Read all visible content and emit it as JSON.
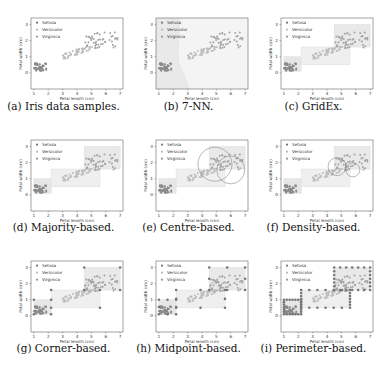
{
  "figure": {
    "panels": [
      {
        "id": "a",
        "caption": "(a) Iris data samples.",
        "overlay": "none"
      },
      {
        "id": "b",
        "caption": "(b) 7-NN.",
        "overlay": "knn"
      },
      {
        "id": "c",
        "caption": "(c) GridEx.",
        "overlay": "boxes"
      },
      {
        "id": "d",
        "caption": "(d) Majority-based.",
        "overlay": "boxes"
      },
      {
        "id": "e",
        "caption": "(e) Centre-based.",
        "overlay": "boxes-circles-large"
      },
      {
        "id": "f",
        "caption": "(f) Density-based.",
        "overlay": "boxes-circles-small"
      },
      {
        "id": "g",
        "caption": "(g) Corner-based.",
        "overlay": "boxes-corners"
      },
      {
        "id": "h",
        "caption": "(h) Midpoint-based.",
        "overlay": "boxes-midpoints"
      },
      {
        "id": "i",
        "caption": "(i) Perimeter-based.",
        "overlay": "boxes-perimeter"
      }
    ],
    "legend": [
      "Setosa",
      "Versicolor",
      "Virginica"
    ],
    "xlabel": "Petal length (cm)",
    "ylabel": "Petal width (cm)",
    "xticks": [
      "1",
      "2",
      "3",
      "4",
      "5",
      "6",
      "7"
    ],
    "yticks": [
      "0",
      "1",
      "2",
      "3"
    ]
  },
  "chart_data": {
    "type": "scatter",
    "title": "",
    "xlabel": "Petal length (cm)",
    "ylabel": "Petal width (cm)",
    "xlim": [
      0.8,
      7.2
    ],
    "ylim": [
      -1,
      3.4
    ],
    "grid": false,
    "legend_position": "upper left",
    "series": [
      {
        "name": "Setosa",
        "x_range": [
          1.0,
          1.9
        ],
        "y_range": [
          0.1,
          0.6
        ]
      },
      {
        "name": "Versicolor",
        "x_range": [
          3.0,
          5.1
        ],
        "y_range": [
          1.0,
          1.8
        ]
      },
      {
        "name": "Virginica",
        "x_range": [
          4.5,
          6.9
        ],
        "y_range": [
          1.4,
          2.5
        ]
      }
    ],
    "boxes_gridex": [
      {
        "class": "Setosa",
        "x": [
          1.0,
          2.2
        ],
        "y": [
          0.1,
          1.0
        ]
      },
      {
        "class": "Versicolor",
        "x": [
          2.2,
          5.6
        ],
        "y": [
          0.5,
          1.6
        ]
      },
      {
        "class": "Virginica",
        "x": [
          4.5,
          7.0
        ],
        "y": [
          1.6,
          3.0
        ]
      }
    ]
  }
}
